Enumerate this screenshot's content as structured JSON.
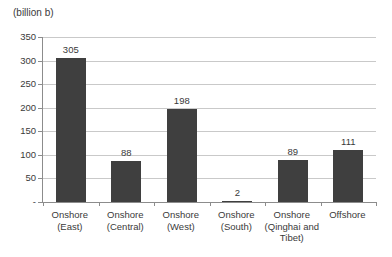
{
  "chart_data": {
    "type": "bar",
    "title": "",
    "unit_label": "(billion b)",
    "xlabel": "",
    "ylabel": "(billion b)",
    "categories": [
      "Onshore (East)",
      "Onshore (Central)",
      "Onshore (West)",
      "Onshore (South)",
      "Onshore (Qinghai and Tibet)",
      "Offshore"
    ],
    "category_label_lines": [
      [
        "Onshore",
        "(East)"
      ],
      [
        "Onshore",
        "(Central)"
      ],
      [
        "Onshore",
        "(West)"
      ],
      [
        "Onshore",
        "(South)"
      ],
      [
        "Onshore",
        "(Qinghai and",
        "Tibet)"
      ],
      [
        "Offshore"
      ]
    ],
    "values": [
      305,
      88,
      198,
      2,
      89,
      111
    ],
    "value_labels": [
      "305",
      "88",
      "198",
      "2",
      "89",
      "111"
    ],
    "ylim": [
      0,
      350
    ],
    "ytick_step": 50,
    "ytick_labels": [
      "-",
      "50",
      "100",
      "150",
      "200",
      "250",
      "300",
      "350"
    ],
    "grid": true,
    "legend": "none",
    "bar_color": "#3f3f3f",
    "gridline_color": "#c9c9c9",
    "axis_color": "#8c8c8c",
    "text_color": "#3a3a3a"
  }
}
